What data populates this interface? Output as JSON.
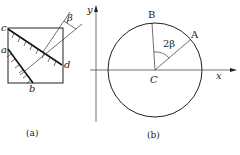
{
  "figure_a": {
    "caption": "(a)",
    "labels": {
      "c": "c",
      "a": "a",
      "d": "d",
      "b": "b",
      "beta": "β"
    }
  },
  "figure_b": {
    "caption": "(b)",
    "labels": {
      "y_axis": "y",
      "x_axis": "x",
      "B": "B",
      "A": "A",
      "C": "C",
      "angle": "2β"
    }
  }
}
